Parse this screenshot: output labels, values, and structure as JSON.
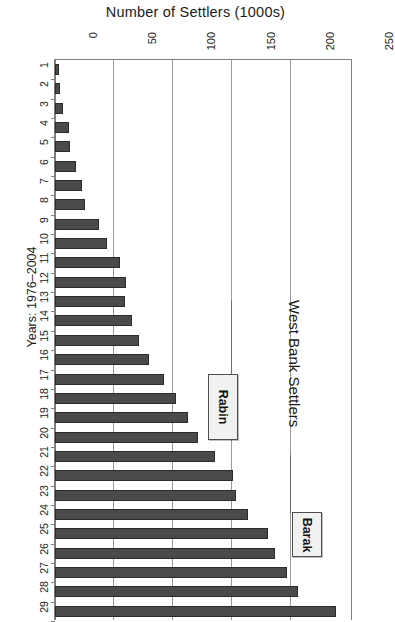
{
  "chart_data": {
    "type": "bar",
    "orientation": "rotated-90",
    "title": "Number of Settlers (1000s)",
    "side_title": "West Bank Settlers",
    "xlabel": "Years: 1976–2004",
    "ylabel": "Number of Settlers (1000s)",
    "grid": true,
    "ylim": [
      0,
      250
    ],
    "yticks": [
      0,
      50,
      100,
      150,
      200,
      250
    ],
    "ytick_labels": [
      "0",
      "50",
      "100",
      "150",
      "200",
      "250"
    ],
    "categories": [
      "1",
      "2",
      "3",
      "4",
      "5",
      "6",
      "7",
      "8",
      "9",
      "10",
      "11",
      "12",
      "13",
      "14",
      "15",
      "16",
      "17",
      "18",
      "19",
      "20",
      "21",
      "22",
      "23",
      "24",
      "25",
      "26",
      "27",
      "28",
      "29"
    ],
    "values": [
      3,
      4,
      7,
      12,
      13,
      18,
      23,
      25,
      37,
      44,
      55,
      60,
      59,
      65,
      71,
      79,
      92,
      102,
      112,
      121,
      135,
      150,
      153,
      163,
      180,
      186,
      196,
      205,
      237
    ],
    "annotations": [
      {
        "label": "Rabin",
        "category": "19"
      },
      {
        "label": "Barak",
        "category": "25"
      }
    ],
    "legend": null,
    "bar_color": "#4a4a4a"
  },
  "axis": {
    "value_axis_name": "Number of Settlers (1000s)",
    "category_axis_name": "Years: 1976–2004"
  },
  "callouts": {
    "rabin": "Rabin",
    "barak": "Barak"
  }
}
